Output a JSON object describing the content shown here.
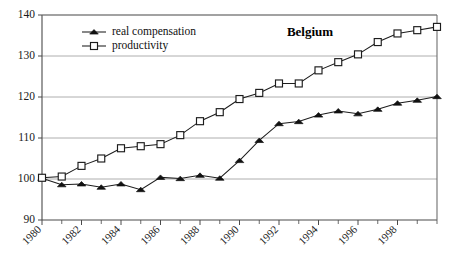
{
  "chart_data": {
    "type": "line",
    "title": "Belgium",
    "xlabel": "",
    "ylabel": "",
    "xlim": [
      1980,
      2000
    ],
    "ylim": [
      90,
      140
    ],
    "yticks": [
      90,
      100,
      110,
      120,
      130,
      140
    ],
    "ytick_labels": [
      "90",
      "100",
      "110",
      "120",
      "130",
      "140"
    ],
    "xticks": [
      1980,
      1982,
      1984,
      1986,
      1988,
      1990,
      1992,
      1994,
      1996,
      1998
    ],
    "xtick_labels": [
      "1980",
      "1982",
      "1984",
      "1986",
      "1988",
      "1990",
      "1992",
      "1994",
      "1996",
      "1998"
    ],
    "x": [
      1980,
      1981,
      1982,
      1983,
      1984,
      1985,
      1986,
      1987,
      1988,
      1989,
      1990,
      1991,
      1992,
      1993,
      1994,
      1995,
      1996,
      1997,
      1998,
      1999,
      2000
    ],
    "grid": true,
    "grid_axis": "y",
    "legend_position": "top-left",
    "series": [
      {
        "name": "real compensation",
        "marker": "filled-triangle",
        "color": "#111111",
        "values": [
          100.2,
          98.6,
          98.8,
          98.0,
          98.8,
          97.4,
          100.4,
          100.1,
          100.9,
          100.2,
          104.5,
          109.4,
          113.5,
          114.0,
          115.6,
          116.6,
          115.9,
          117.0,
          118.5,
          119.2,
          120.1
        ]
      },
      {
        "name": "productivity",
        "marker": "open-square",
        "color": "#1c1c1c",
        "values": [
          100.3,
          100.6,
          103.2,
          105.0,
          107.5,
          108.0,
          108.5,
          110.7,
          114.1,
          116.3,
          119.5,
          121.0,
          123.3,
          123.3,
          126.5,
          128.5,
          130.4,
          133.4,
          135.5,
          136.3,
          137.1
        ]
      }
    ]
  },
  "legend": {
    "entries": [
      {
        "label": "real compensation"
      },
      {
        "label": "productivity"
      }
    ]
  }
}
